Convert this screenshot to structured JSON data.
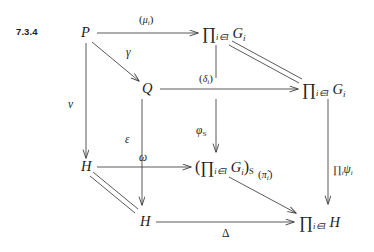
{
  "figure": {
    "section_number": "7.3.4",
    "kind": "commutative-diagram"
  },
  "nodes": {
    "p": "P",
    "q": "Q",
    "h_left": "H",
    "h_bottom": "H",
    "prod_g_top": "∏",
    "prod_g_top_index": "i∈I",
    "prod_g_top_obj": "G",
    "prod_g_top_obj_sub": "i",
    "prod_g_right": "∏",
    "prod_g_right_index": "i∈I",
    "prod_g_right_obj": "G",
    "prod_g_right_obj_sub": "i",
    "prod_g_s_open": "(",
    "prod_g_s": "∏",
    "prod_g_s_index": "i∈I",
    "prod_g_s_obj": "G",
    "prod_g_s_obj_sub": "i",
    "prod_g_s_close": ")",
    "prod_g_s_sub": "S",
    "prod_h": "∏",
    "prod_h_index": "i∈I",
    "prod_h_obj": "H"
  },
  "arrows": {
    "mu": {
      "open": "(",
      "sym": "μ",
      "sub": "i",
      "close": ")"
    },
    "gamma": {
      "sym": "γ"
    },
    "nu": {
      "sym": "ν"
    },
    "delta": {
      "open": "(",
      "sym": "δ",
      "sub": "i",
      "close": ")"
    },
    "epsilon": {
      "sym": "ε"
    },
    "phi_s": {
      "sym": "φ",
      "sub": "S"
    },
    "omega": {
      "sym": "ω"
    },
    "pi_tilde": {
      "open": "(",
      "sym": "π̃",
      "sub": "i",
      "close": ")"
    },
    "pi_psi": {
      "op": "∏",
      "op_sub": "i",
      "sym": "ψ",
      "sub": "i"
    },
    "delta_bottom": {
      "sym": "Δ"
    }
  },
  "style": {
    "stroke": "#3c3c3c",
    "text": "#1c1c1c",
    "background": "#ffffff"
  }
}
